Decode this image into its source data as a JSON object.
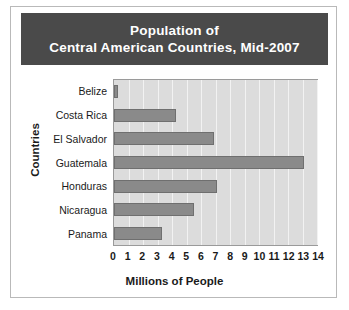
{
  "title": {
    "line1": "Population of",
    "line2": "Central American Countries, Mid-2007"
  },
  "axes": {
    "ylabel": "Countries",
    "xlabel": "Millions of People"
  },
  "colors": {
    "banner": "#4a4a4a",
    "banner_text": "#ffffff",
    "plot_background": "#dcdcdc",
    "gridline": "#f2f2f2",
    "bar_fill": "#8a8a8a",
    "bar_edge": "#6f6f6f",
    "frame": "#b9b9b9"
  },
  "chart_data": {
    "type": "bar",
    "orientation": "horizontal",
    "title": "Population of Central American Countries, Mid-2007",
    "xlabel": "Millions of People",
    "ylabel": "Countries",
    "categories": [
      "Belize",
      "Costa Rica",
      "El Salvador",
      "Guatemala",
      "Honduras",
      "Nicaragua",
      "Panama"
    ],
    "values": [
      0.3,
      4.3,
      6.9,
      13.1,
      7.1,
      5.5,
      3.3
    ],
    "xlim": [
      0,
      14
    ],
    "xticks": [
      0,
      1,
      2,
      3,
      4,
      5,
      6,
      7,
      8,
      9,
      10,
      11,
      12,
      13,
      14
    ],
    "xtick_labels": [
      "0",
      "1",
      "2",
      "3",
      "4",
      "5",
      "6",
      "7",
      "8",
      "9",
      "10",
      "11",
      "12",
      "13",
      "14"
    ],
    "grid": "vertical",
    "legend": null
  }
}
